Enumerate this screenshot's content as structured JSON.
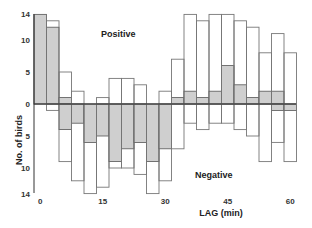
{
  "chart_data": {
    "type": "bar",
    "title": "",
    "xlabel": "LAG (min)",
    "ylabel": "No. of birds",
    "annotations": [
      "Positive",
      "Negative"
    ],
    "x_ticks": [
      "0",
      "15",
      "30",
      "45",
      "60"
    ],
    "y_ticks_positive": [
      "0",
      "5",
      "10",
      "14"
    ],
    "y_ticks_negative": [
      "5",
      "10",
      "14"
    ],
    "ylim": [
      -14,
      14
    ],
    "bin_width_min": 3,
    "x": [
      0,
      3,
      6,
      9,
      12,
      15,
      18,
      21,
      24,
      27,
      30,
      33,
      36,
      39,
      42,
      45,
      48,
      51,
      54,
      57,
      60
    ],
    "series": [
      {
        "name": "Positive total (open)",
        "values": [
          14,
          13,
          5,
          2,
          0,
          1,
          4,
          4,
          3,
          0,
          2,
          7,
          14,
          13,
          14,
          14,
          13,
          12,
          8,
          11,
          8
        ]
      },
      {
        "name": "Positive significant (shaded)",
        "values": [
          14,
          12,
          1,
          0,
          0,
          0,
          0,
          0,
          0,
          0,
          0,
          1,
          2,
          1,
          2,
          6,
          3,
          1,
          2,
          2,
          0
        ]
      },
      {
        "name": "Negative total (open)",
        "values": [
          0,
          1,
          9,
          12,
          14,
          13,
          10,
          10,
          11,
          14,
          12,
          7,
          3,
          4,
          3,
          3,
          4,
          5,
          9,
          6,
          9
        ]
      },
      {
        "name": "Negative significant (shaded)",
        "values": [
          0,
          0,
          4,
          3,
          6,
          5,
          9,
          7,
          6,
          9,
          7,
          0,
          0,
          0,
          0,
          0,
          0,
          0,
          0,
          1,
          1
        ]
      }
    ],
    "grid": false,
    "colors": {
      "shaded": "#cfcfcf",
      "outline": "#777777",
      "axis": "#333333"
    }
  },
  "labels": {
    "positive": "Positive",
    "negative": "Negative",
    "xlabel": "LAG (min)",
    "ylabel": "No. of birds"
  }
}
